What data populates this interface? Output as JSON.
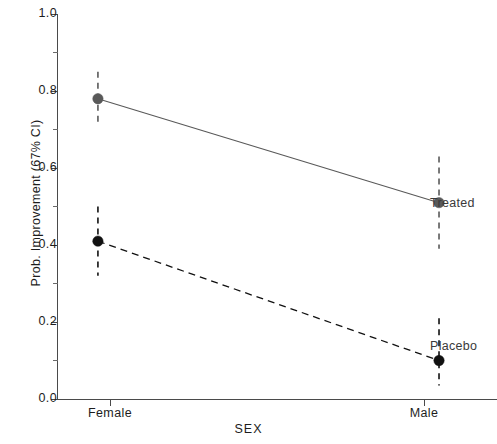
{
  "chart_data": {
    "type": "line",
    "title": "",
    "subtitle": "",
    "xlabel": "SEX",
    "ylabel": "Prob. Improvement (67% CI)",
    "categories": [
      "Female",
      "Male"
    ],
    "x": [
      0,
      1
    ],
    "xlim": [
      -0.12,
      1.17
    ],
    "ylim": [
      0.0,
      1.0
    ],
    "grid": false,
    "legend_position": "inline-right",
    "y_ticks": [
      "0.0",
      "0.2",
      "0.4",
      "0.6",
      "0.8",
      "1.0"
    ],
    "y_tick_values": [
      0.0,
      0.2,
      0.4,
      0.6,
      0.8,
      1.0
    ],
    "y_minor_tick_values": [
      0.1,
      0.3,
      0.5,
      0.7,
      0.9
    ],
    "series": [
      {
        "name": "Treated",
        "values": [
          0.78,
          0.51
        ],
        "ci_low": [
          0.71,
          0.39
        ],
        "ci_high": [
          0.85,
          0.63
        ],
        "color": "#595959",
        "line_style": "solid",
        "marker": "circle"
      },
      {
        "name": "Placebo",
        "values": [
          0.41,
          0.1
        ],
        "ci_low": [
          0.32,
          0.035
        ],
        "ci_high": [
          0.5,
          0.21
        ],
        "color": "#111111",
        "line_style": "dashed",
        "marker": "circle"
      }
    ],
    "annotations": [
      {
        "text": "Treated",
        "x": 1,
        "y": 0.51
      },
      {
        "text": "Placebo",
        "x": 1,
        "y": 0.1
      }
    ]
  },
  "axes": {
    "y_labels": [
      "1.0",
      "0.8",
      "0.6",
      "0.4",
      "0.2",
      "0.0"
    ],
    "x_labels": [
      "Female",
      "Male"
    ],
    "y_title": "Prob. Improvement (67% CI)",
    "x_title": "SEX"
  },
  "labels": {
    "treated": "Treated",
    "placebo": "Placebo"
  },
  "colors": {
    "treated": "#595959",
    "placebo": "#111111",
    "axis": "#4a4a4a",
    "background": "#ffffff"
  }
}
